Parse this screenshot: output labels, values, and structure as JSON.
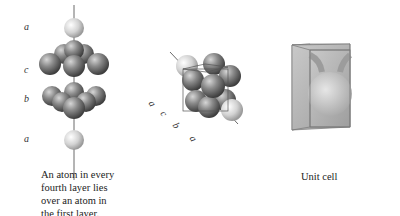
{
  "panel_left": {
    "layer_labels": [
      "a",
      "c",
      "b",
      "a"
    ],
    "caption_lines": [
      "An atom in every",
      "fourth layer lies",
      "over an atom in",
      "the first layer."
    ]
  },
  "panel_middle": {
    "axis_labels": [
      "a",
      "c",
      "b",
      "a"
    ]
  },
  "panel_right": {
    "caption": "Unit cell"
  },
  "colors": {
    "light_atom": "#d8d8d8",
    "dark_atom": "#7a7a7a",
    "cube_face": "#b5b5b5"
  }
}
